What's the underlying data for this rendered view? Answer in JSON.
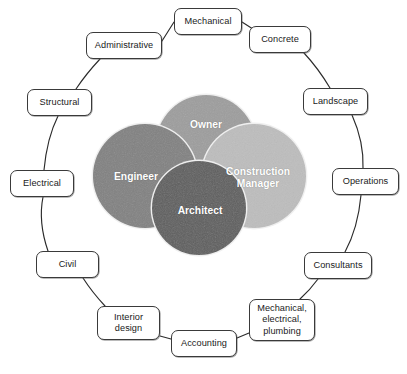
{
  "diagram": {
    "canvas": {
      "width": 407,
      "height": 374,
      "background": "#ffffff"
    },
    "core_circles": [
      {
        "id": "owner",
        "label": "Owner",
        "cx": 206,
        "cy": 145,
        "r": 50,
        "fill": "#9d9d9d",
        "label_x": 206,
        "label_y": 125,
        "z": 1
      },
      {
        "id": "construction-manager",
        "label": "Construction\nManager",
        "cx": 254,
        "cy": 176,
        "r": 52,
        "fill": "#bdbdbd",
        "label_x": 258,
        "label_y": 178,
        "z": 2
      },
      {
        "id": "engineer",
        "label": "Engineer",
        "cx": 145,
        "cy": 176,
        "r": 52,
        "fill": "#818181",
        "label_x": 136,
        "label_y": 177,
        "z": 3
      },
      {
        "id": "architect",
        "label": "Architect",
        "cx": 199,
        "cy": 208,
        "r": 47,
        "fill": "#5e5e5e",
        "label_x": 200,
        "label_y": 211,
        "z": 4
      }
    ],
    "outer_nodes": [
      {
        "id": "mechanical",
        "label": "Mechanical",
        "x": 174,
        "y": 8,
        "w": 68,
        "h": 27
      },
      {
        "id": "concrete",
        "label": "Concrete",
        "x": 249,
        "y": 26,
        "w": 62,
        "h": 27
      },
      {
        "id": "landscape",
        "label": "Landscape",
        "x": 303,
        "y": 88,
        "w": 65,
        "h": 27
      },
      {
        "id": "operations",
        "label": "Operations",
        "x": 332,
        "y": 168,
        "w": 67,
        "h": 27
      },
      {
        "id": "consultants",
        "label": "Consultants",
        "x": 304,
        "y": 252,
        "w": 68,
        "h": 27
      },
      {
        "id": "mep",
        "label": "Mechanical,\nelectrical,\nplumbing",
        "x": 249,
        "y": 299,
        "w": 66,
        "h": 42
      },
      {
        "id": "accounting",
        "label": "Accounting",
        "x": 171,
        "y": 330,
        "w": 66,
        "h": 27
      },
      {
        "id": "interior-design",
        "label": "Interior\ndesign",
        "x": 97,
        "y": 306,
        "w": 63,
        "h": 34
      },
      {
        "id": "civil",
        "label": "Civil",
        "x": 36,
        "y": 251,
        "w": 63,
        "h": 27
      },
      {
        "id": "electrical",
        "label": "Electrical",
        "x": 10,
        "y": 170,
        "w": 64,
        "h": 27
      },
      {
        "id": "structural",
        "label": "Structural",
        "x": 27,
        "y": 89,
        "w": 65,
        "h": 27
      },
      {
        "id": "administrative",
        "label": "Administrative",
        "x": 86,
        "y": 32,
        "w": 76,
        "h": 27
      }
    ],
    "connectors": [
      {
        "from": "mechanical",
        "to": "administrative",
        "path": "M 174,22 L 162,41"
      },
      {
        "from": "mechanical",
        "to": "concrete",
        "path": "M 242,22 L 256,31"
      },
      {
        "from": "concrete",
        "to": "landscape",
        "path": "M 304,53 Q 318,68 330,88"
      },
      {
        "from": "landscape",
        "to": "operations",
        "path": "M 352,115 Q 364,142 363,168"
      },
      {
        "from": "operations",
        "to": "consultants",
        "path": "M 361,195 Q 358,228 345,252"
      },
      {
        "from": "consultants",
        "to": "mep",
        "path": "M 318,279 Q 310,290 300,299"
      },
      {
        "from": "mep",
        "to": "accounting",
        "path": "M 249,333 L 237,338"
      },
      {
        "from": "accounting",
        "to": "interior-design",
        "path": "M 171,339 L 160,336"
      },
      {
        "from": "interior-design",
        "to": "civil",
        "path": "M 105,306 Q 92,292 83,278"
      },
      {
        "from": "civil",
        "to": "electrical",
        "path": "M 48,251 Q 38,222 43,197"
      },
      {
        "from": "electrical",
        "to": "structural",
        "path": "M 44,170 Q 47,138 58,116"
      },
      {
        "from": "structural",
        "to": "administrative",
        "path": "M 76,89 Q 86,74 100,59"
      }
    ],
    "style": {
      "box_border_color": "#3a3a3a",
      "box_fill": "#ffffff",
      "box_text_color": "#1a1a1a",
      "connector_color": "#2b2b2b",
      "circle_text_color": "#ffffff",
      "circle_edge_highlight": "#efefef"
    }
  }
}
